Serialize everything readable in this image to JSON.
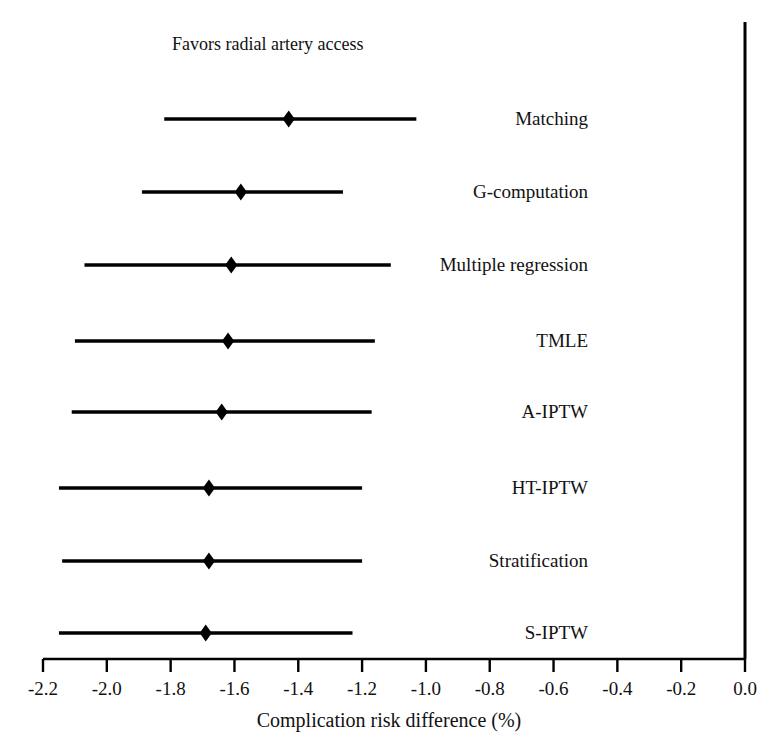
{
  "chart_data": {
    "type": "scatter",
    "subtype": "forest-plot",
    "title": "",
    "annotation": "Favors radial artery access",
    "xlabel": "Complication risk difference (%)",
    "ylabel": "",
    "xlim": [
      -2.3,
      0.05
    ],
    "grid": false,
    "legend": null,
    "reference_line": 0.0,
    "xticks": [
      -2.2,
      -2.0,
      -1.8,
      -1.6,
      -1.4,
      -1.2,
      -1.0,
      -0.8,
      -0.6,
      -0.4,
      -0.2,
      0.0
    ],
    "xticklabels": [
      "-2.2",
      "-2.0",
      "-1.8",
      "-1.6",
      "-1.4",
      "-1.2",
      "-1.0",
      "-0.8",
      "-0.6",
      "-0.4",
      "-0.2",
      "0.0"
    ],
    "categories": [
      "Matching",
      "G-computation",
      "Multiple regression",
      "TMLE",
      "A-IPTW",
      "HT-IPTW",
      "Stratification",
      "S-IPTW"
    ],
    "values": [
      -1.43,
      -1.58,
      -1.61,
      -1.62,
      -1.64,
      -1.68,
      -1.68,
      -1.69
    ],
    "ci_low": [
      -1.82,
      -1.89,
      -2.07,
      -2.1,
      -2.11,
      -2.15,
      -2.14,
      -2.15
    ],
    "ci_high": [
      -1.03,
      -1.26,
      -1.11,
      -1.16,
      -1.17,
      -1.2,
      -1.2,
      -1.23
    ],
    "points": [
      {
        "label": "Matching",
        "estimate": -1.43,
        "ci_low": -1.82,
        "ci_high": -1.03
      },
      {
        "label": "G-computation",
        "estimate": -1.58,
        "ci_low": -1.89,
        "ci_high": -1.26
      },
      {
        "label": "Multiple regression",
        "estimate": -1.61,
        "ci_low": -2.07,
        "ci_high": -1.11
      },
      {
        "label": "TMLE",
        "estimate": -1.62,
        "ci_low": -2.1,
        "ci_high": -1.16
      },
      {
        "label": "A-IPTW",
        "estimate": -1.64,
        "ci_low": -2.11,
        "ci_high": -1.17
      },
      {
        "label": "HT-IPTW",
        "estimate": -1.68,
        "ci_low": -2.15,
        "ci_high": -1.2
      },
      {
        "label": "Stratification",
        "estimate": -1.68,
        "ci_low": -2.14,
        "ci_high": -1.2
      },
      {
        "label": "S-IPTW",
        "estimate": -1.69,
        "ci_low": -2.15,
        "ci_high": -1.23
      }
    ],
    "marker": "diamond",
    "marker_color": "#000000",
    "line_color": "#000000",
    "axis_color": "#000000",
    "background": "#ffffff"
  },
  "labels": {
    "favors": "Favors radial artery access",
    "axis_title": "Complication risk difference (%)",
    "row_0": "Matching",
    "row_1": "G-computation",
    "row_2": "Multiple regression",
    "row_3": "TMLE",
    "row_4": "A-IPTW",
    "row_5": "HT-IPTW",
    "row_6": "Stratification",
    "row_7": "S-IPTW",
    "tick_0": "-2.2",
    "tick_1": "-2.0",
    "tick_2": "-1.8",
    "tick_3": "-1.6",
    "tick_4": "-1.4",
    "tick_5": "-1.2",
    "tick_6": "-1.0",
    "tick_7": "-0.8",
    "tick_8": "-0.6",
    "tick_9": "-0.4",
    "tick_10": "-0.2",
    "tick_11": "0.0"
  }
}
